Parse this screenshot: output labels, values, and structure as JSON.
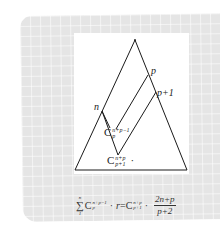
{
  "diagram": {
    "type": "pascal-triangle-region",
    "colors": {
      "card_background": "#e5e5e5",
      "panel_background": "#ffffff",
      "stroke": "#1a1a1a"
    },
    "labels": {
      "n": "n",
      "p": "p",
      "p_plus_1": "p+1"
    },
    "combinations": {
      "inner": {
        "base": "C",
        "sup": "n+p−1",
        "sub": "p"
      },
      "outer": {
        "base": "C",
        "sup": "n+p",
        "sub": "p+1",
        "trailing": "·"
      }
    }
  },
  "formula": {
    "sum_symbol": "∑",
    "sum_upper": "n",
    "sum_lower": "1",
    "term_base": "C",
    "term_sup": "n+p−1",
    "term_sub": "p",
    "dot1": "·",
    "variable": "r",
    "equals": "=",
    "rhs_base": "C",
    "rhs_sup": "n+p",
    "rhs_sub": "p+1",
    "dot2": "·",
    "fraction_numerator": "2n+p",
    "fraction_denominator": "p+2"
  }
}
